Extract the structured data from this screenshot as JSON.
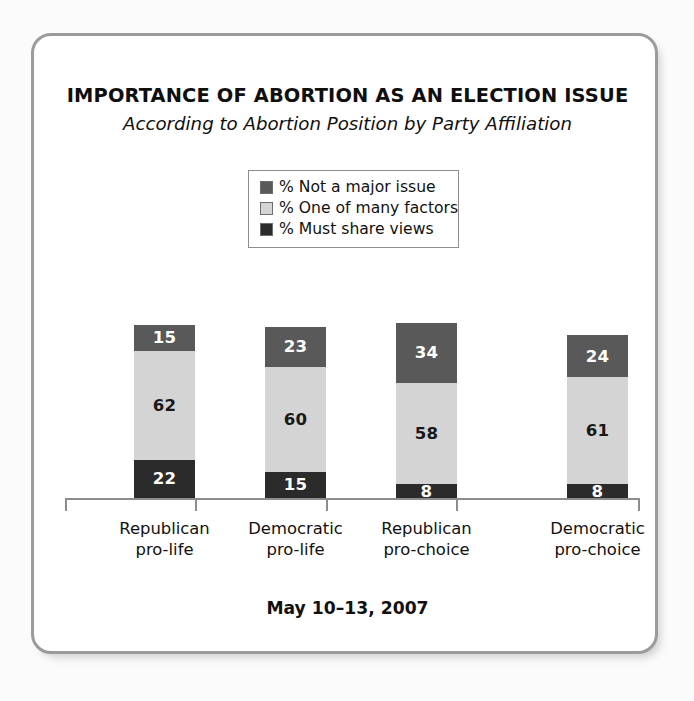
{
  "figure": {
    "frame_border_color": "#9b9b9b",
    "background_color": "#ffffff",
    "page_background_color": "#fbfbfb"
  },
  "footer": {
    "date_range": "May 10–13, 2007"
  },
  "chart_data": {
    "type": "bar",
    "subtype": "stacked-vertical",
    "title": "IMPORTANCE OF ABORTION AS AN ELECTION ISSUE",
    "subtitle": "According to Abortion Position by Party Affiliation",
    "xlabel": "",
    "ylabel": "",
    "ylim": [
      0,
      100
    ],
    "grid": false,
    "legend_position": "top-center",
    "value_labels_shown": true,
    "categories": [
      "Republican pro-life",
      "Democratic pro-life",
      "Republican pro-choice",
      "Democratic pro-choice"
    ],
    "category_lines": [
      [
        "Republican",
        "pro-life"
      ],
      [
        "Democratic",
        "pro-life"
      ],
      [
        "Republican",
        "pro-choice"
      ],
      [
        "Democratic",
        "pro-choice"
      ]
    ],
    "stack_order_bottom_to_top": [
      "% Must share views",
      "% One of many factors",
      "% Not a major issue"
    ],
    "series": [
      {
        "name": "% Not a major issue",
        "color": "#595959",
        "label_color": "#ffffff",
        "values": [
          15,
          23,
          34,
          24
        ]
      },
      {
        "name": "% One of many factors",
        "color": "#d4d4d4",
        "label_color": "#1a1919",
        "values": [
          62,
          60,
          58,
          61
        ]
      },
      {
        "name": "% Must share views",
        "color": "#2b2b2b",
        "label_color": "#ffffff",
        "values": [
          22,
          15,
          8,
          8
        ]
      }
    ],
    "column_totals": [
      99,
      98,
      100,
      93
    ],
    "annotations": [
      "May 10–13, 2007"
    ]
  }
}
